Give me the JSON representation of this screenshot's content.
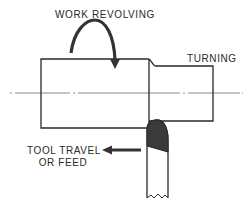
{
  "diagram": {
    "labels": {
      "work_revolving": "WORK REVOLVING",
      "turning": "TURNING",
      "tool_travel_line1": "TOOL TRAVEL",
      "tool_travel_line2": "OR FEED"
    },
    "colors": {
      "line": "#2a2a2a",
      "tool_tip_fill": "#3a3a3a",
      "background": "#ffffff",
      "centerline": "#6a6a6a"
    },
    "elements": [
      "workpiece-large-diameter",
      "workpiece-turned-diameter",
      "centerline",
      "rotation-arrow",
      "cutting-tool",
      "feed-arrow"
    ]
  }
}
